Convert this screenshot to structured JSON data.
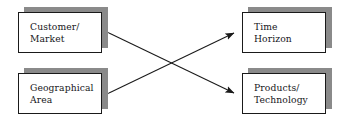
{
  "diagram": {
    "background_color": "#ffffff",
    "box_border_color": "#1a1a1a",
    "box_fill_color": "#ffffff",
    "shadow_color": "#8a8a8a",
    "arrow_color": "#1a1a1a",
    "nodes": [
      {
        "id": "customer-market",
        "label": "Customer/\nMarket",
        "position": "top-left"
      },
      {
        "id": "time-horizon",
        "label": "Time\nHorizon",
        "position": "top-right"
      },
      {
        "id": "geographical-area",
        "label": "Geographical\nArea",
        "position": "bottom-left"
      },
      {
        "id": "products-technology",
        "label": "Products/\nTechnology",
        "position": "bottom-right"
      }
    ],
    "connectors": [
      {
        "id": "customer-market--to--products-technology",
        "from": "customer-market",
        "to": "products-technology",
        "style": "double-headed-arrow"
      },
      {
        "id": "geographical-area--to--time-horizon",
        "from": "geographical-area",
        "to": "time-horizon",
        "style": "double-headed-arrow"
      }
    ]
  }
}
